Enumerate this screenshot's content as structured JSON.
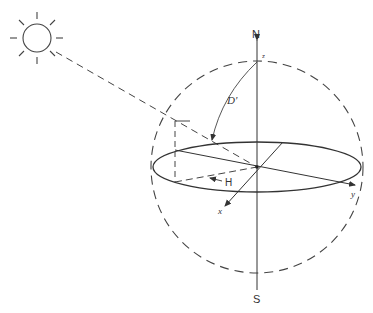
{
  "diagram": {
    "type": "celestial-sphere-sun-position",
    "labels": {
      "north": "N",
      "south": "S",
      "zenith_axis": "z",
      "x_axis": "x",
      "y_axis": "y",
      "zenith_angle": "D'",
      "hour_angle": "H"
    },
    "colors": {
      "stroke": "#333333",
      "background": "#ffffff"
    },
    "elements": [
      "sun-icon",
      "sun-ray-dashed-line",
      "celestial-sphere-dashed-circle",
      "horizon-ellipse",
      "polar-axis-N-S",
      "x-axis-arrow",
      "y-axis-arrow",
      "zenith-angle-arc",
      "hour-angle-arrow",
      "projection-dashed-lines"
    ]
  }
}
